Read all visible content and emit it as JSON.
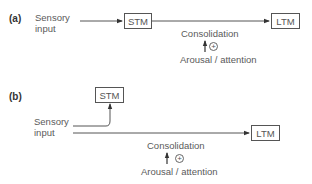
{
  "diagram": {
    "panel_a": {
      "label": "(a)",
      "input_line1": "Sensory",
      "input_line2": "input",
      "stm_label": "STM",
      "ltm_label": "LTM",
      "consolidation_label": "Consolidation",
      "modulator_sign": "+",
      "modulator_label": "Arousal / attention",
      "flow": [
        "Sensory input",
        "STM",
        "LTM"
      ]
    },
    "panel_b": {
      "label": "(b)",
      "input_line1": "Sensory",
      "input_line2": "input",
      "stm_label": "STM",
      "ltm_label": "LTM",
      "consolidation_label": "Consolidation",
      "modulator_sign": "+",
      "modulator_label": "Arousal / attention",
      "flow": [
        "Sensory input -> STM",
        "Sensory input -> LTM"
      ]
    },
    "colors": {
      "line": "#555555",
      "text": "#5a5a5a",
      "panel_label": "#333333"
    }
  }
}
